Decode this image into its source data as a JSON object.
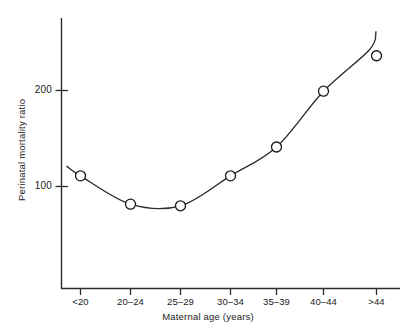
{
  "chart_data": {
    "type": "line",
    "title": "",
    "xlabel": "Maternal age (years)",
    "ylabel": "Perinatal mortality ratio",
    "categories": [
      "<20",
      "20–24",
      "25–29",
      "30–34",
      "35–39",
      "40–44",
      ">44"
    ],
    "values": [
      108,
      88,
      87,
      108,
      133,
      199,
      257
    ],
    "series": [
      {
        "name": "Perinatal mortality ratio",
        "values": [
          108,
          88,
          87,
          108,
          133,
          199,
          257
        ]
      }
    ],
    "y_ticks": [
      100,
      200
    ],
    "y_tick_labels": [
      "100",
      "200"
    ],
    "ylim": [
      55,
      290
    ],
    "yscale": "log",
    "grid": false,
    "legend": false,
    "legend_position": "none",
    "marker": "open-circle",
    "line_style": "smooth-fitted-curve",
    "annotations": []
  },
  "axes": {
    "x_title": "Maternal age (years)",
    "y_title": "Perinatal mortality ratio",
    "x_tick_labels": [
      "<20",
      "20–24",
      "25–29",
      "30–34",
      "35–39",
      "40–44",
      ">44"
    ],
    "y_tick_labels": [
      "200",
      "100"
    ]
  },
  "colors": {
    "background": "#ffffff",
    "axis": "#2b2b2b",
    "curve": "#2b2b2b",
    "marker_stroke": "#1a1a1a",
    "marker_fill": "#ffffff",
    "text": "#1a1a1a"
  }
}
